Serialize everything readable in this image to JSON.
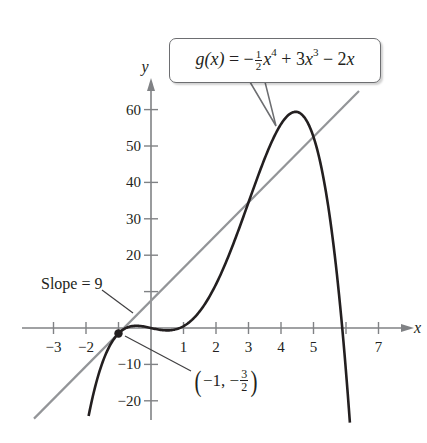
{
  "chart_data": {
    "type": "line",
    "title": "",
    "xlabel": "x",
    "ylabel": "y",
    "xlim": [
      -3.3,
      8.0
    ],
    "ylim": [
      -24,
      66
    ],
    "grid": false,
    "x_ticks": [
      -3,
      -2,
      -1,
      1,
      2,
      3,
      4,
      5,
      6,
      7
    ],
    "x_tick_labels": [
      "−3",
      "−2",
      "",
      "1",
      "2",
      "3",
      "4",
      "5",
      "",
      "7"
    ],
    "y_ticks": [
      -20,
      -10,
      10,
      20,
      30,
      40,
      50,
      60
    ],
    "y_tick_labels": [
      "−20",
      "−10",
      "",
      "20",
      "30",
      "40",
      "50",
      "60"
    ],
    "series": [
      {
        "name": "g(x) = −(1/2)x^4 + 3x^3 − 2x",
        "kind": "function",
        "coefficients": {
          "x4": -0.5,
          "x3": 3,
          "x2": 0,
          "x1": -2,
          "x0": 0
        },
        "domain": [
          -1.92,
          6.12
        ],
        "color": "#231f20",
        "width": 2.6,
        "x": [
          -1.9,
          -1.5,
          -1,
          -0.5,
          0,
          0.5,
          1,
          1.5,
          2,
          2.5,
          3,
          3.5,
          4,
          4.5,
          5,
          5.5,
          6,
          6.1
        ],
        "values": [
          -23.3,
          -10.6,
          -1.5,
          0.6,
          0,
          -0.66,
          0.5,
          4.6,
          12,
          21.3,
          34.5,
          45.0,
          56,
          59.7,
          50,
          20.3,
          -12,
          -23.5
        ]
      },
      {
        "name": "Tangent line, slope 9",
        "kind": "line",
        "slope": 9,
        "intercept": 7.5,
        "domain": [
          -3.6,
          6.4
        ],
        "color": "#939598",
        "width": 2.2,
        "x": [
          -3.6,
          6.4
        ],
        "values": [
          -24.9,
          65.1
        ]
      }
    ],
    "points": [
      {
        "x": -1,
        "y": -1.5,
        "label": "(−1, −3/2)"
      }
    ],
    "annotations": [
      {
        "text": "Slope = 9",
        "target": "tangent line"
      },
      {
        "text": "g(x) = −½x⁴ + 3x³ − 2x",
        "target": "curve",
        "style": "callout"
      },
      {
        "text": "(−1, −3/2)",
        "target": "point of tangency"
      }
    ],
    "legend": null
  },
  "labels": {
    "x_axis": "x",
    "y_axis": "y",
    "slope": "Slope = 9",
    "callout": {
      "fn": "g(x)",
      "eq": " = −",
      "frac_num": "1",
      "frac_den": "2",
      "var1": "x",
      "exp1": "4",
      "plus": " + 3",
      "var2": "x",
      "exp2": "3",
      "minus": " − 2",
      "var3": "x"
    },
    "point": {
      "open": "(",
      "x": "−1, −",
      "frac_num": "3",
      "frac_den": "2",
      "close": ")"
    }
  }
}
